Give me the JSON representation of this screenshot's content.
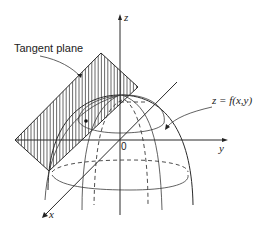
{
  "figure": {
    "type": "tangent-plane-diagram",
    "labels": {
      "tangent_plane": "Tangent plane",
      "surface": "z = f(x,y)",
      "x_axis": "x",
      "y_axis": "y",
      "z_axis": "z",
      "origin": "0"
    },
    "colors": {
      "ink": "#2a2a2a",
      "background": "#ffffff"
    }
  }
}
